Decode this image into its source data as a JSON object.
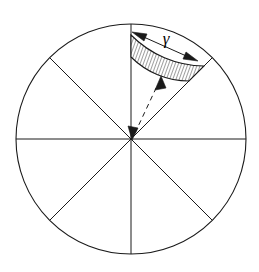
{
  "figure": {
    "background_color": "#ffffff",
    "stroke_color": "#1a1a1a",
    "hatch_color": "#1a1a1a",
    "canvas": {
      "width": 259,
      "height": 272
    }
  },
  "circle": {
    "center_x": 131,
    "center_y": 139,
    "radius": 115,
    "stroke_width": 1.1
  },
  "spokes": [
    {
      "name": "vertical-diameter",
      "angle_deg": 90,
      "label": ""
    },
    {
      "name": "horizontal-diameter",
      "angle_deg": 0,
      "label": ""
    },
    {
      "name": "diagonal-diameter-45",
      "angle_deg": 45,
      "label": ""
    },
    {
      "name": "diagonal-diameter-135",
      "angle_deg": 135,
      "label": ""
    }
  ],
  "sector_count": 8,
  "hatched_band": {
    "name": "hatched-annular-band",
    "sector_start_angle_deg": 45,
    "sector_end_angle_deg": 90,
    "inner_radius": 82,
    "outer_radius": 104,
    "hatch_spacing": 3,
    "hatch_angle_deg": 20,
    "fill": "#ffffff"
  },
  "dimension_arrow": {
    "name": "gamma-dimension-arrow",
    "label": "γ",
    "label_x": 168,
    "label_y": 40,
    "start_x": 134,
    "start_y": 33,
    "end_x": 196,
    "end_y": 60,
    "double_headed": true
  },
  "radial_arrow": {
    "name": "radial-dashed-arrow",
    "start_x": 133,
    "start_y": 137,
    "end_x": 161,
    "end_y": 78,
    "double_headed": true,
    "dash_pattern": "5,4"
  }
}
